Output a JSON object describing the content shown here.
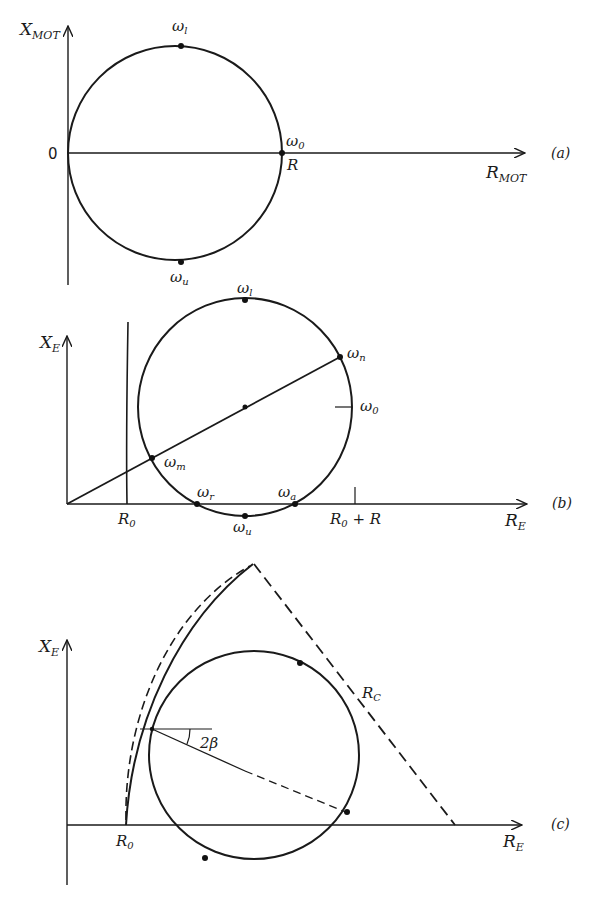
{
  "panels": [
    {
      "id": "a",
      "tag": "(a)",
      "y_axis_label": "X",
      "y_axis_sub": "MOT",
      "x_axis_label": "R",
      "x_axis_sub": "MOT",
      "origin_label": "0",
      "points": {
        "top": {
          "sym": "ω",
          "sub": "l"
        },
        "bottom": {
          "sym": "ω",
          "sub": "u"
        },
        "right": {
          "sym": "ω",
          "sub": "0"
        },
        "right_value": "R"
      }
    },
    {
      "id": "b",
      "tag": "(b)",
      "y_axis_label": "X",
      "y_axis_sub": "E",
      "x_axis_label": "R",
      "x_axis_sub": "E",
      "ticks": {
        "r0": {
          "main": "R",
          "sub": "0"
        },
        "r0_plus_r": {
          "main": "R",
          "sub": "0",
          "suffix": " + R"
        }
      },
      "points": {
        "top": {
          "sym": "ω",
          "sub": "l"
        },
        "bottom": {
          "sym": "ω",
          "sub": "u"
        },
        "n": {
          "sym": "ω",
          "sub": "n"
        },
        "zero": {
          "sym": "ω",
          "sub": "0"
        },
        "m": {
          "sym": "ω",
          "sub": "m"
        },
        "r": {
          "sym": "ω",
          "sub": "r"
        },
        "a": {
          "sym": "ω",
          "sub": "a"
        }
      }
    },
    {
      "id": "c",
      "tag": "(c)",
      "y_axis_label": "X",
      "y_axis_sub": "E",
      "x_axis_label": "R",
      "x_axis_sub": "E",
      "r0": {
        "main": "R",
        "sub": "0"
      },
      "rc": {
        "main": "R",
        "sub": "C"
      },
      "angle_label": "2β"
    }
  ]
}
